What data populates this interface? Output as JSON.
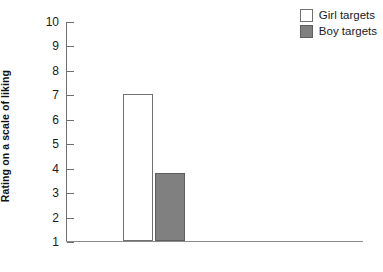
{
  "chart_data": {
    "type": "bar",
    "title": "",
    "subtitle": "",
    "xlabel": "",
    "ylabel": "Rating on a scale of liking",
    "categories": [
      "Girl raters",
      "Boy raters"
    ],
    "series": [
      {
        "name": "Girl targets",
        "values": [
          7.0,
          4.0
        ],
        "color": "#ffffff",
        "edge_color": "#707070"
      },
      {
        "name": "Boy targets",
        "values": [
          3.8,
          5.7
        ],
        "color": "#808080",
        "edge_color": "#5f5f5f"
      }
    ],
    "ylim": [
      1,
      10
    ],
    "ytick_labels": [
      "10",
      "9",
      "8",
      "7",
      "6",
      "5",
      "4",
      "3",
      "2",
      "1"
    ],
    "ytick_values": [
      10,
      9,
      8,
      7,
      6,
      5,
      4,
      3,
      2,
      1
    ],
    "grid": false,
    "legend_position": "top-right",
    "legend_entries": [
      "Girl targets",
      "Boy targets"
    ]
  }
}
